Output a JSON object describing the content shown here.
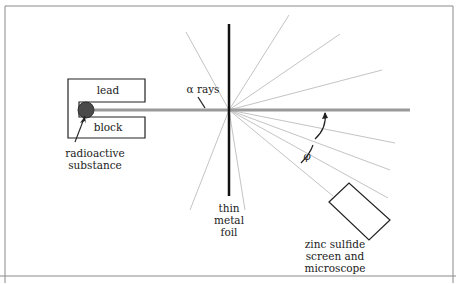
{
  "diagram": {
    "labels": {
      "lead": "lead",
      "block": "block",
      "alpha_rays": "α rays",
      "radioactive_line1": "radioactive",
      "radioactive_line2": "substance",
      "foil_line1": "thin",
      "foil_line2": "metal",
      "foil_line3": "foil",
      "detector_line1": "zinc sulfide",
      "detector_line2": "screen and",
      "detector_line3": "microscope",
      "angle": "φ"
    },
    "colors": {
      "frame": "#8a8a8a",
      "beam": "#9a9a9a",
      "rays": "#c4c4c4",
      "foil": "#111111",
      "source": "#444444",
      "outline": "#222222"
    }
  }
}
